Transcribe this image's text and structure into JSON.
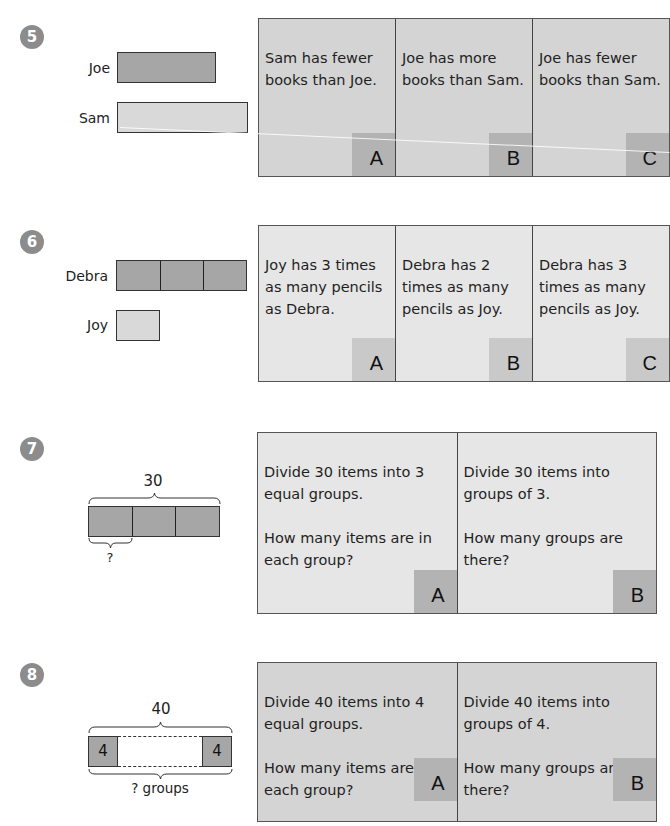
{
  "problems": [
    {
      "number": "5",
      "bars": [
        {
          "label": "Joe",
          "shade": "dark",
          "units": 1
        },
        {
          "label": "Sam",
          "shade": "light",
          "units": 1
        }
      ],
      "choices": [
        {
          "text": "Sam has fewer books than Joe.",
          "letter": "A"
        },
        {
          "text": "Joe has more books than Sam.",
          "letter": "B"
        },
        {
          "text": "Joe has fewer books than Sam.",
          "letter": "C"
        }
      ]
    },
    {
      "number": "6",
      "bars": [
        {
          "label": "Debra",
          "shade": "dark",
          "units": 3
        },
        {
          "label": "Joy",
          "shade": "light",
          "units": 1
        }
      ],
      "choices": [
        {
          "text": "Joy has 3 times as many pencils as Debra.",
          "letter": "A"
        },
        {
          "text": "Debra has 2 times as many pencils as Joy.",
          "letter": "B"
        },
        {
          "text": "Debra has 3 times as many pencils as Joy.",
          "letter": "C"
        }
      ]
    },
    {
      "number": "7",
      "diagram": {
        "total_label": "30",
        "part_label": "?",
        "segments": 3
      },
      "choices": [
        {
          "text": "Divide 30 items into 3 equal groups.",
          "question": "How many items are in each group?",
          "letter": "A"
        },
        {
          "text": "Divide 30 items into groups of 3.",
          "question": "How many groups are there?",
          "letter": "B"
        }
      ]
    },
    {
      "number": "8",
      "diagram": {
        "total_label": "40",
        "left_box": "4",
        "right_box": "4",
        "bottom_label": "? groups"
      },
      "choices": [
        {
          "text": "Divide 40 items into 4 equal groups.",
          "question": "How many items are in each group?",
          "letter": "A"
        },
        {
          "text": "Divide 40 items into groups of 4.",
          "question": "How many groups are there?",
          "letter": "B"
        }
      ]
    }
  ],
  "colors": {
    "badge": "#8c8c8c",
    "bar_dark": "#a6a6a6",
    "bar_light": "#d9d9d9",
    "card_dark": "#d4d4d4",
    "card_light": "#e6e6e6",
    "letter_box": "#b3b3b3"
  }
}
